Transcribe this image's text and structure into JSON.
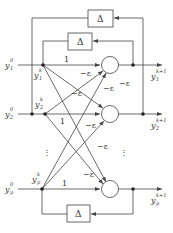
{
  "diagram": {
    "type": "hopfield-style feedback network",
    "colors": {
      "line": "#444444",
      "text": "#333333",
      "background": "#ffffff"
    },
    "delay_label": "Δ",
    "inputs": [
      {
        "base": "y",
        "sub": "1",
        "sup": "0"
      },
      {
        "base": "y",
        "sub": "2",
        "sup": "0"
      },
      {
        "base": "y",
        "sub": "p",
        "sup": "0"
      }
    ],
    "states": [
      {
        "base": "y",
        "sub": "1",
        "sup": "k"
      },
      {
        "base": "y",
        "sub": "2",
        "sup": "k"
      },
      {
        "base": "y",
        "sub": "p",
        "sup": "k"
      }
    ],
    "outputs": [
      {
        "base": "y",
        "sub": "1",
        "sup": "k+1"
      },
      {
        "base": "y",
        "sub": "2",
        "sup": "k+1"
      },
      {
        "base": "y",
        "sub": "p",
        "sup": "k+1"
      }
    ],
    "self_weight": "1",
    "cross_weight": "−ε",
    "ellipsis": "⋮"
  }
}
